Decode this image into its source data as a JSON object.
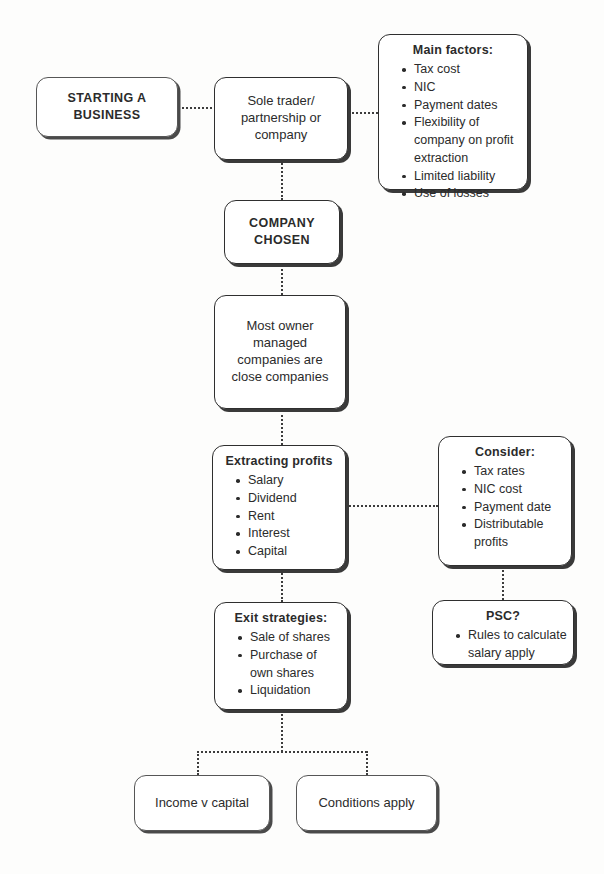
{
  "diagram": {
    "accent_color": "#2f2f2f",
    "text_color": "#2b2b2b",
    "background_color": "#fdfdfc",
    "connector_style": "dotted"
  },
  "nodes": {
    "starting_business": {
      "label": "STARTING A\nBUSINESS",
      "line1": "STARTING A",
      "line2": "BUSINESS"
    },
    "sole_trader": {
      "line1": "Sole trader/",
      "line2": "partnership or",
      "line3": "company"
    },
    "main_factors": {
      "title": "Main factors:",
      "items": [
        "Tax cost",
        "NIC",
        "Payment dates",
        "Flexibility of company on profit extraction",
        "Limited liability",
        "Use of losses"
      ]
    },
    "company_chosen": {
      "line1": "COMPANY",
      "line2": "CHOSEN"
    },
    "close_companies": {
      "line1": "Most owner",
      "line2": "managed",
      "line3": "companies are",
      "line4": "close companies"
    },
    "extracting_profits": {
      "title": "Extracting profits",
      "items": [
        "Salary",
        "Dividend",
        "Rent",
        "Interest",
        "Capital"
      ]
    },
    "consider": {
      "title": "Consider:",
      "items": [
        "Tax rates",
        "NIC cost",
        "Payment date",
        "Distributable profits"
      ]
    },
    "exit_strategies": {
      "title": "Exit strategies:",
      "items": [
        "Sale of shares",
        "Purchase of own shares",
        "Liquidation"
      ]
    },
    "psc": {
      "title": "PSC?",
      "items": [
        "Rules to calculate salary apply"
      ]
    },
    "income_v_capital": {
      "label": "Income v capital"
    },
    "conditions_apply": {
      "label": "Conditions apply"
    }
  }
}
